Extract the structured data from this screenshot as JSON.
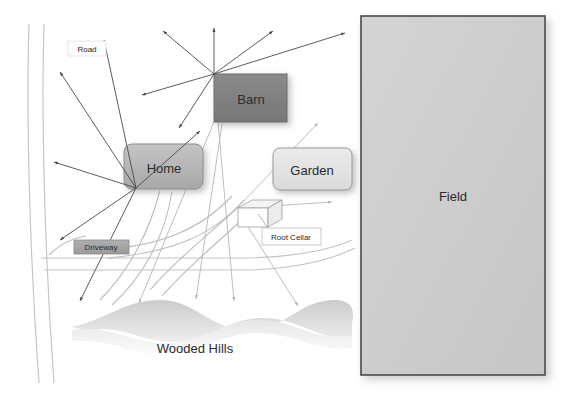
{
  "diagram": {
    "background_color": "#ffffff",
    "width": 581,
    "height": 406
  },
  "shapes": {
    "barn": {
      "label": "Barn",
      "kind": "rectangle",
      "x": 214,
      "y": 74,
      "w": 73,
      "h": 48,
      "fill": "#7f7f7f",
      "stroke": "#5e5e5e",
      "text_color": "#ffffff",
      "font_size": 13
    },
    "home": {
      "label": "Home",
      "kind": "rounded-rectangle",
      "x": 124,
      "y": 144,
      "w": 79,
      "h": 45,
      "fill": "#b4b4b4",
      "stroke": "#8f8f8f",
      "text_color": "#1a1a1a",
      "font_size": 13
    },
    "garden": {
      "label": "Garden",
      "kind": "rounded-rectangle",
      "x": 273,
      "y": 148,
      "w": 79,
      "h": 42,
      "fill": "#e2e2e2",
      "stroke": "#9a9a9a",
      "text_color": "#1a1a1a",
      "font_size": 13
    },
    "field": {
      "label": "Field",
      "kind": "rectangle",
      "x": 361,
      "y": 16,
      "w": 184,
      "h": 359,
      "fill": "#cfcfcf",
      "stroke": "#4a4a4a",
      "text_color": "#1a1a1a",
      "font_size": 13
    },
    "root_cellar": {
      "label": "Root Cellar",
      "kind": "isometric-box",
      "x": 238,
      "y": 202,
      "w": 42,
      "h": 25,
      "fill": "#ffffff",
      "stroke": "#8c8c8c",
      "text_color": "#1a1a1a",
      "font_size": 8
    },
    "wooded_hills": {
      "label": "Wooded Hills",
      "kind": "wave-band",
      "text_color": "#1a1a1a",
      "font_size": 13,
      "fill_top": "#d9d9d9",
      "fill_bottom": "#f2f2f2"
    }
  },
  "labels": {
    "road": {
      "text": "Road",
      "x": 68,
      "y": 41,
      "w": 38,
      "h": 15,
      "fill": "#fdfdfd",
      "stroke": "#dcdcdc",
      "text_color": "#1a1a1a",
      "font_size": 8
    },
    "driveway": {
      "text": "Driveway",
      "x": 74,
      "y": 240,
      "w": 55,
      "h": 14,
      "fill": "#a6a6a6",
      "stroke": "#8a8a8a",
      "text_color": "#111111",
      "font_size": 8
    },
    "root_cellar_tag": {
      "text": "Root Cellar",
      "x": 262,
      "y": 228,
      "w": 59,
      "h": 17,
      "fill": "#ffffff",
      "stroke": "#b9b9b9",
      "text_color": "#1a1a1a",
      "font_size": 8
    },
    "wooded_hills_tag": {
      "text": "Wooded Hills",
      "x": 195,
      "y": 347,
      "text_color": "#1a1a1a",
      "font_size": 13
    },
    "field_tag": {
      "text": "Field",
      "x": 453,
      "y": 195,
      "text_color": "#1a1a1a",
      "font_size": 13
    }
  },
  "hubs": {
    "home_hub": {
      "x": 136,
      "y": 188,
      "color": "#4a4a4a"
    },
    "barn_hub": {
      "x": 214,
      "y": 74,
      "color": "#4a4a4a"
    },
    "cellar_hub": {
      "x": 240,
      "y": 205,
      "color": "#b0b0b0"
    },
    "garden_hub": {
      "x": 240,
      "y": 220,
      "color": "#bdbdbd"
    }
  },
  "arrows": {
    "dark_color": "#4a4a4a",
    "light_color": "#b5b5b5",
    "from_home": [
      {
        "x2": 104,
        "y2": 40
      },
      {
        "x2": 60,
        "y2": 72
      },
      {
        "x2": 54,
        "y2": 162
      },
      {
        "x2": 60,
        "y2": 240
      },
      {
        "x2": 80,
        "y2": 301
      },
      {
        "x2": 200,
        "y2": 131
      }
    ],
    "from_barn": [
      {
        "x2": 163,
        "y2": 31
      },
      {
        "x2": 214,
        "y2": 28
      },
      {
        "x2": 273,
        "y2": 31
      },
      {
        "x2": 345,
        "y2": 33
      },
      {
        "x2": 142,
        "y2": 95
      },
      {
        "x2": 179,
        "y2": 128
      }
    ],
    "from_cellar": [
      {
        "x2": 318,
        "y2": 123
      },
      {
        "x2": 330,
        "y2": 201
      },
      {
        "x2": 234,
        "y2": 300
      },
      {
        "x2": 296,
        "y2": 305
      }
    ],
    "from_barn_lower": [
      {
        "x2": 139,
        "y2": 303
      },
      {
        "x2": 196,
        "y2": 299
      }
    ]
  },
  "roads": {
    "stroke": "#bfbfbf",
    "driveway_stroke": "#bfbfbf"
  }
}
